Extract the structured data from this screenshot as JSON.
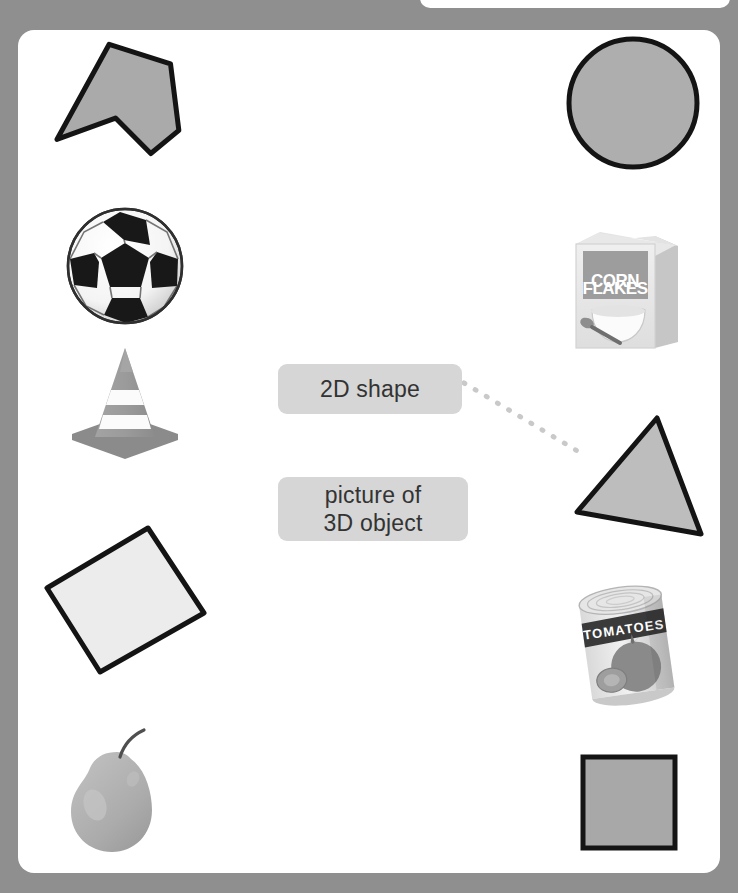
{
  "worksheet": {
    "title": "2D shape and 3D object sorting activity",
    "background_color": "#8f8f8f",
    "panel_color": "#ffffff"
  },
  "cards": {
    "two_d": {
      "label": "2D shape"
    },
    "three_d": {
      "line1": "picture of",
      "line2": "3D object"
    },
    "card_color": "#d6d6d6",
    "text_color": "#333333"
  },
  "connector": {
    "style": "dotted",
    "color": "#c9c9c9",
    "from": "2D shape card",
    "to": "triangle shape"
  },
  "shapes": [
    {
      "name": "arrow-pentagon",
      "kind": "2D shape",
      "fill": "#aaaaaa",
      "stroke": "#1a1a1a"
    },
    {
      "name": "circle",
      "kind": "2D shape",
      "fill": "#aaaaaa",
      "stroke": "#1a1a1a"
    },
    {
      "name": "triangle",
      "kind": "2D shape",
      "fill": "#bdbdbd",
      "stroke": "#1a1a1a"
    },
    {
      "name": "rectangle-tilted",
      "kind": "2D shape",
      "fill": "#ececec",
      "stroke": "#1a1a1a"
    },
    {
      "name": "square",
      "kind": "2D shape",
      "fill": "#a8a8a8",
      "stroke": "#1a1a1a"
    }
  ],
  "objects": [
    {
      "name": "soccer-ball",
      "kind": "picture of 3D object"
    },
    {
      "name": "traffic-cone",
      "kind": "picture of 3D object"
    },
    {
      "name": "cereal-box",
      "kind": "picture of 3D object",
      "label_line1": "CORN",
      "label_line2": "FLAKES"
    },
    {
      "name": "tomato-can",
      "kind": "picture of 3D object",
      "label": "TOMATOES"
    },
    {
      "name": "pear",
      "kind": "picture of 3D object"
    }
  ],
  "watermark": {
    "text": ""
  }
}
